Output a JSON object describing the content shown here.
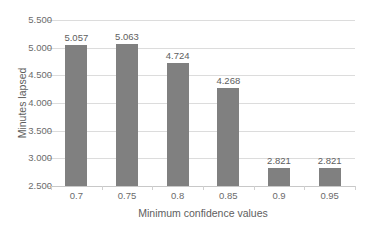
{
  "chart_data": {
    "type": "bar",
    "title": "",
    "xlabel": "Minimum confidence values",
    "ylabel": "Minutes lapsed",
    "categories": [
      "0.7",
      "0.75",
      "0.8",
      "0.85",
      "0.9",
      "0.95"
    ],
    "values": [
      5.057,
      5.063,
      4.724,
      4.268,
      2.821,
      2.821
    ],
    "value_labels": [
      "5.057",
      "5.063",
      "4.724",
      "4.268",
      "2.821",
      "2.821"
    ],
    "ylim": [
      2.5,
      5.5
    ],
    "ytick_labels": [
      "5.500",
      "5.000",
      "4.500",
      "4.000",
      "3.500",
      "3.000",
      "2.500"
    ],
    "ytick_values": [
      5.5,
      5.0,
      4.5,
      4.0,
      3.5,
      3.0,
      2.5
    ],
    "grid": true,
    "legend": false,
    "series": [
      {
        "name": "Minutes lapsed",
        "color": "#808080",
        "values": [
          5.057,
          5.063,
          4.724,
          4.268,
          2.821,
          2.821
        ]
      }
    ],
    "colors": {
      "bar": "#808080",
      "gridline": "#dcdcdc",
      "axis_line": "#c8c8c8",
      "tick_text": "#6b6b6b",
      "title_text": "#5e5e5e",
      "background": "#ffffff"
    }
  }
}
